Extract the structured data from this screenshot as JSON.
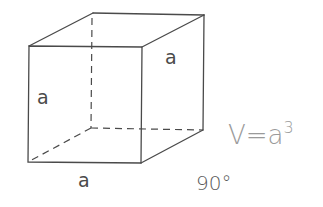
{
  "diagram": {
    "type": "cube",
    "labels": {
      "front_height": "a",
      "right_depth": "a",
      "bottom_width": "a"
    },
    "formula": {
      "lhs": "V=a",
      "exponent": "3"
    },
    "angle_label": "90°",
    "colors": {
      "edges": "#4a4a4a",
      "formula": "#9a9a9a"
    }
  }
}
